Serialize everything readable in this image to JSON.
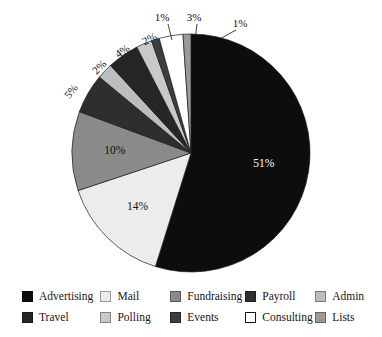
{
  "chart_data": {
    "type": "pie",
    "title": "",
    "subtitle": "",
    "xlabel": "",
    "ylabel": "",
    "grid": false,
    "legend_position": "bottom",
    "start_angle_deg": 0,
    "direction": "clockwise",
    "categories": [
      "Advertising",
      "Mail",
      "Fundraising",
      "Payroll",
      "Admin",
      "Travel",
      "Polling",
      "Events",
      "Consulting",
      "Lists"
    ],
    "values": [
      51,
      14,
      10,
      5,
      2,
      4,
      2,
      1,
      3,
      1
    ],
    "value_unit": "%",
    "colors": [
      "#0d0d0d",
      "#ececec",
      "#8a8a8a",
      "#2e2e2e",
      "#bdbdbd",
      "#262626",
      "#c9c9c9",
      "#3d3d3d",
      "#ffffff",
      "#9a9a9a"
    ],
    "slices": [
      {
        "label": "Advertising",
        "value": 51,
        "display": "51%",
        "color": "#0d0d0d",
        "label_placement": "inside",
        "label_color": "#ffffff"
      },
      {
        "label": "Mail",
        "value": 14,
        "display": "14%",
        "color": "#ececec",
        "label_placement": "inside",
        "label_color": "#111111"
      },
      {
        "label": "Fundraising",
        "value": 10,
        "display": "10%",
        "color": "#8a8a8a",
        "label_placement": "inside",
        "label_color": "#111111"
      },
      {
        "label": "Payroll",
        "value": 5,
        "display": "5%",
        "color": "#2e2e2e",
        "label_placement": "outside",
        "label_color": "#111111"
      },
      {
        "label": "Admin",
        "value": 2,
        "display": "2%",
        "color": "#bdbdbd",
        "label_placement": "outside",
        "label_color": "#111111"
      },
      {
        "label": "Travel",
        "value": 4,
        "display": "4%",
        "color": "#262626",
        "label_placement": "outside",
        "label_color": "#111111"
      },
      {
        "label": "Polling",
        "value": 2,
        "display": "2%",
        "color": "#c9c9c9",
        "label_placement": "outside",
        "label_color": "#111111"
      },
      {
        "label": "Events",
        "value": 1,
        "display": "1%",
        "color": "#3d3d3d",
        "label_placement": "outside-leader",
        "label_color": "#111111"
      },
      {
        "label": "Consulting",
        "value": 3,
        "display": "3%",
        "color": "#ffffff",
        "label_placement": "outside-leader",
        "label_color": "#111111"
      },
      {
        "label": "Lists",
        "value": 1,
        "display": "1%",
        "color": "#9a9a9a",
        "label_placement": "outside-leader",
        "label_color": "#111111"
      }
    ]
  },
  "labels": {
    "advertising_pct": "51%",
    "mail_pct": "14%",
    "fundraising_pct": "10%",
    "payroll_pct": "5%",
    "admin_pct": "2%",
    "travel_pct": "4%",
    "polling_pct": "2%",
    "events_pct": "1%",
    "consulting_pct": "3%",
    "lists_pct": "1%"
  },
  "legend": {
    "rows": [
      [
        {
          "label": "Advertising",
          "color": "#0d0d0d",
          "outlined": false
        },
        {
          "label": "Mail",
          "color": "#ececec",
          "outlined": false
        },
        {
          "label": "Fundraising",
          "color": "#8a8a8a",
          "outlined": false
        },
        {
          "label": "Payroll",
          "color": "#2e2e2e",
          "outlined": false
        },
        {
          "label": "Admin",
          "color": "#bdbdbd",
          "outlined": false
        }
      ],
      [
        {
          "label": "Travel",
          "color": "#262626",
          "outlined": false
        },
        {
          "label": "Polling",
          "color": "#c9c9c9",
          "outlined": false
        },
        {
          "label": "Events",
          "color": "#3d3d3d",
          "outlined": false
        },
        {
          "label": "Consulting",
          "color": "#ffffff",
          "outlined": true
        },
        {
          "label": "Lists",
          "color": "#9a9a9a",
          "outlined": false
        }
      ]
    ]
  }
}
